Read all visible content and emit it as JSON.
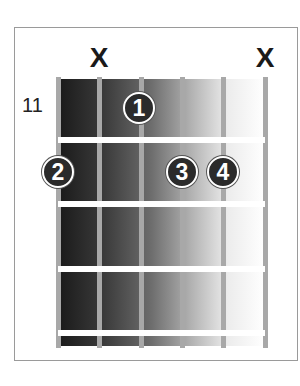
{
  "chord": {
    "start_fret": "11",
    "muted_strings": [
      {
        "string": 2,
        "label": "X"
      },
      {
        "string": 6,
        "label": "X"
      }
    ],
    "fingers": [
      {
        "finger": "1",
        "string": 3,
        "fret": 1
      },
      {
        "finger": "2",
        "string": 1,
        "fret": 2
      },
      {
        "finger": "3",
        "string": 4,
        "fret": 2
      },
      {
        "finger": "4",
        "string": 5,
        "fret": 2
      }
    ],
    "num_strings": 6,
    "num_frets_shown": 4
  },
  "colors": {
    "dot_fill": "#2b2b2b",
    "dot_border": "#ffffff",
    "string": "#a8a8a8",
    "frame_border": "#9a9a9a"
  }
}
